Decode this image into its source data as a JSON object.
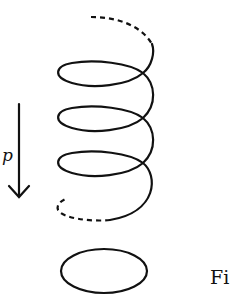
{
  "figure": {
    "arrow_label": "p",
    "caption_fragment": "Fi",
    "colors": {
      "stroke": "#111111",
      "background": "#ffffff"
    },
    "helix": {
      "solid_turns": 3,
      "dashed_ends": [
        "top",
        "bottom"
      ]
    },
    "projection_shape": "ellipse"
  }
}
